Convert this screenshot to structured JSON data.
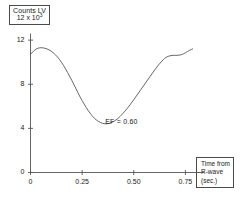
{
  "chart_data": {
    "type": "line",
    "title": "",
    "subtitle": "",
    "ylabel_line1": "Counts LV",
    "ylabel_line2_base": "12 x 10",
    "ylabel_line2_exp": "3",
    "xlabel_line1": "Time from",
    "xlabel_line2": "R-wave",
    "xlabel_line3": "(sec.)",
    "xlabel": "Time from R-wave (sec.)",
    "ylabel": "Counts LV 12 x 10^3",
    "xlim": [
      0,
      0.84
    ],
    "ylim": [
      0,
      12.6
    ],
    "grid": false,
    "legend": "none",
    "xticks": [
      0,
      0.25,
      0.5,
      0.75
    ],
    "xtick_labels": [
      "0",
      "0.25",
      "0.50",
      "0.75"
    ],
    "yticks": [
      0,
      4,
      8,
      12
    ],
    "ytick_labels": [
      "0",
      "4",
      "8",
      "12"
    ],
    "annotations": [
      {
        "text": "EF = 0.60",
        "x": 0.42,
        "y": 4.6
      }
    ],
    "series": [
      {
        "name": "LV counts",
        "color": "#555555",
        "x": [
          0.0,
          0.015,
          0.03,
          0.045,
          0.06,
          0.08,
          0.1,
          0.12,
          0.14,
          0.16,
          0.18,
          0.2,
          0.22,
          0.24,
          0.26,
          0.28,
          0.3,
          0.32,
          0.34,
          0.36,
          0.38,
          0.4,
          0.42,
          0.44,
          0.47,
          0.5,
          0.53,
          0.56,
          0.59,
          0.62,
          0.65,
          0.67,
          0.69,
          0.71,
          0.73,
          0.75,
          0.77,
          0.785
        ],
        "y": [
          10.7,
          11.0,
          11.22,
          11.3,
          11.3,
          11.2,
          11.0,
          10.68,
          10.25,
          9.7,
          9.05,
          8.35,
          7.6,
          6.85,
          6.2,
          5.6,
          5.1,
          4.75,
          4.52,
          4.42,
          4.45,
          4.6,
          4.85,
          5.2,
          5.85,
          6.6,
          7.4,
          8.2,
          9.0,
          9.75,
          10.35,
          10.55,
          10.62,
          10.62,
          10.68,
          10.85,
          11.08,
          11.2
        ]
      }
    ]
  },
  "axis": {
    "color": "#555555",
    "line_color": "#555555"
  }
}
